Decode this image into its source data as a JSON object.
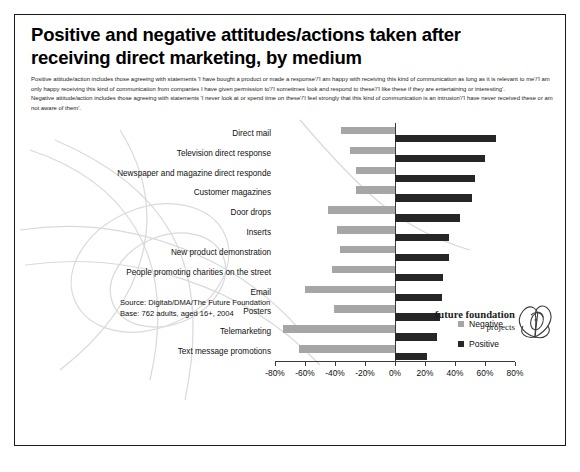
{
  "title": "Positive and negative attitudes/actions taken after receiving direct marketing, by medium",
  "subtitle": {
    "line1": "Positive attitude/action includes those agreeing with statements 'I have bought a product or made a response'/'I am happy with receiving this kind of communication as long as it is relevant to me'/'I am only happy receiving this kind of communication from companies I have given permission to'/'I sometimes look and respond to these'/'I like these if they are entertaining or interesting'.",
    "line2": "Negative attitude/action includes those agreeing with statements 'I never look at or spend time on these'/'I feel strongly that this kind of communication is an intrusion'/'I have never received these or am not aware of them'."
  },
  "source": {
    "line1": "Source: Digitab/DMA/The Future Foundation",
    "line2": "Base: 762 adults, aged 16+,  2004"
  },
  "logo": {
    "main": "future foundation",
    "sub": "projects"
  },
  "colors": {
    "negative": "#a6a6a6",
    "positive": "#262626",
    "axis": "#3a3a3a",
    "border": "#1a1a1a"
  },
  "chart_data": {
    "type": "bar",
    "orientation": "horizontal",
    "stacked": false,
    "diverging": true,
    "title": "Positive and negative attitudes/actions taken after receiving direct marketing, by medium",
    "xlabel": "",
    "ylabel": "",
    "xlim": [
      -80,
      80
    ],
    "xticks": [
      -80,
      -60,
      -40,
      -20,
      0,
      20,
      40,
      60,
      80
    ],
    "xticklabels": [
      "-80%",
      "-60%",
      "-40%",
      "-20%",
      "0%",
      "20%",
      "40%",
      "60%",
      "80%"
    ],
    "grid": false,
    "legend_position": "right",
    "categories": [
      "Direct mail",
      "Television direct response",
      "Newspaper and magazine direct responde",
      "Customer magazines",
      "Door drops",
      "Inserts",
      "New product demonstration",
      "People promoting charities on the street",
      "Email",
      "Posters",
      "Telemarketing",
      "Text message promotions"
    ],
    "series": [
      {
        "name": "Negative",
        "color": "#a6a6a6",
        "values": [
          -36,
          -30,
          -26,
          -26,
          -45,
          -39,
          -37,
          -42,
          -60,
          -41,
          -75,
          -64
        ]
      },
      {
        "name": "Positive",
        "color": "#262626",
        "values": [
          67,
          60,
          53,
          51,
          43,
          36,
          36,
          32,
          31,
          30,
          28,
          21
        ]
      }
    ]
  }
}
